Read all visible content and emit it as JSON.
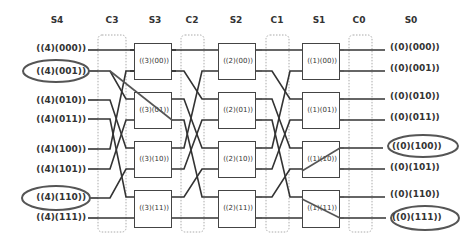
{
  "headers": {
    "s4": "S4",
    "c3": "C3",
    "s3": "S3",
    "c2": "C2",
    "s2": "S2",
    "c1": "C1",
    "s1": "S1",
    "c0": "C0",
    "s0": "S0"
  },
  "inputs": [
    {
      "label": "((4)(000))",
      "highlighted": false
    },
    {
      "label": "((4)(001))",
      "highlighted": true
    },
    {
      "label": "((4)(010))",
      "highlighted": false
    },
    {
      "label": "((4)(011))",
      "highlighted": false
    },
    {
      "label": "((4)(100))",
      "highlighted": false
    },
    {
      "label": "((4)(101))",
      "highlighted": false
    },
    {
      "label": "((4)(110))",
      "highlighted": true
    },
    {
      "label": "((4)(111))",
      "highlighted": false
    }
  ],
  "outputs": [
    {
      "label": "((0)(000))",
      "highlighted": false
    },
    {
      "label": "((0)(001))",
      "highlighted": false
    },
    {
      "label": "((0)(010))",
      "highlighted": false
    },
    {
      "label": "((0)(011))",
      "highlighted": false
    },
    {
      "label": "((0)(100))",
      "highlighted": true
    },
    {
      "label": "((0)(101))",
      "highlighted": false
    },
    {
      "label": "((0)(110))",
      "highlighted": false
    },
    {
      "label": "((0)(111))",
      "highlighted": true
    }
  ],
  "stage3": [
    "((3)(00))",
    "((3)(01))",
    "((3)(10))",
    "((3)(11))"
  ],
  "stage2": [
    "((2)(00))",
    "((2)(01))",
    "((2)(10))",
    "((2)(11))"
  ],
  "stage1": [
    "((1)(00))",
    "((1)(01))",
    "((1)(10))",
    "((1)(11))"
  ],
  "colors": {
    "line": "#333333",
    "highlight_line": "#666666",
    "dotted": "#aaaaaa"
  }
}
